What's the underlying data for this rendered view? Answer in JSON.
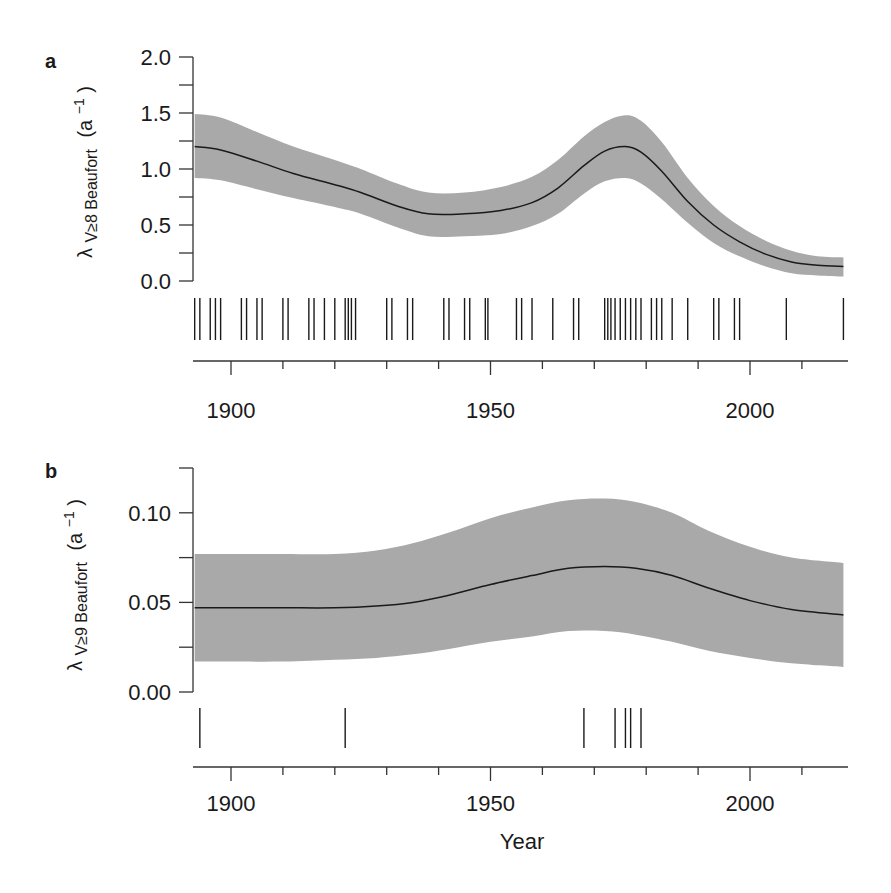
{
  "figure": {
    "colors": {
      "band": "#a9a9a9",
      "line": "#1a1a1a",
      "axis": "#333333",
      "rug": "#1a1a1a"
    }
  },
  "chart_data": [
    {
      "type": "line",
      "panel_label": "a",
      "title": "",
      "xlabel": "",
      "ylabel": "λ̂ V≥8 Beaufort (a⁻¹)",
      "ylabel_parts": {
        "hat": "λ",
        "subscript": "V≥8 Beaufort",
        "units": "(a",
        "units_exp": "−1",
        "units_close": ")"
      },
      "xlim": [
        1892.5,
        2019
      ],
      "ylim": [
        0.0,
        2.0
      ],
      "yticks": [
        0.0,
        0.5,
        1.0,
        1.5,
        2.0
      ],
      "ytick_labels": [
        "0.0",
        "0.5",
        "1.0",
        "1.5",
        "2.0"
      ],
      "yminor_step": 0.25,
      "xticks": [
        1900,
        1950,
        2000
      ],
      "xtick_labels": [
        "1900",
        "1950",
        "2000"
      ],
      "xminor_step": 10,
      "grid": false,
      "series": [
        {
          "name": "estimate",
          "x": [
            1893,
            1898,
            1905,
            1912,
            1920,
            1925,
            1932,
            1938,
            1945,
            1952,
            1958,
            1963,
            1968,
            1972,
            1976,
            1979,
            1983,
            1988,
            1993,
            1998,
            2003,
            2008,
            2013,
            2018
          ],
          "y": [
            1.2,
            1.17,
            1.07,
            0.96,
            0.86,
            0.79,
            0.67,
            0.6,
            0.6,
            0.63,
            0.7,
            0.83,
            1.03,
            1.16,
            1.2,
            1.15,
            0.98,
            0.71,
            0.5,
            0.35,
            0.24,
            0.17,
            0.14,
            0.13
          ],
          "lower": [
            0.92,
            0.9,
            0.82,
            0.74,
            0.66,
            0.6,
            0.48,
            0.4,
            0.4,
            0.42,
            0.49,
            0.6,
            0.78,
            0.89,
            0.92,
            0.87,
            0.73,
            0.52,
            0.34,
            0.22,
            0.13,
            0.07,
            0.05,
            0.04
          ],
          "upper": [
            1.49,
            1.46,
            1.33,
            1.2,
            1.08,
            1.0,
            0.87,
            0.79,
            0.79,
            0.84,
            0.93,
            1.08,
            1.29,
            1.42,
            1.48,
            1.43,
            1.24,
            0.92,
            0.67,
            0.49,
            0.36,
            0.27,
            0.22,
            0.21
          ]
        }
      ],
      "rug_events": [
        1893,
        1894,
        1896,
        1897,
        1898,
        1902,
        1903,
        1905,
        1906,
        1910,
        1911,
        1915,
        1916,
        1918,
        1920,
        1922,
        1922.6,
        1923.2,
        1924,
        1930,
        1931,
        1934,
        1935,
        1941,
        1942,
        1945,
        1946,
        1949,
        1949.5,
        1955,
        1956,
        1958,
        1962,
        1966,
        1967,
        1972,
        1972.6,
        1973.2,
        1974,
        1975,
        1976,
        1977,
        1978,
        1979,
        1981,
        1982,
        1983,
        1985,
        1988,
        1993,
        1994,
        1997,
        1998,
        2007,
        2018
      ]
    },
    {
      "type": "line",
      "panel_label": "b",
      "title": "",
      "xlabel": "Year",
      "ylabel": "λ̂ V≥9 Beaufort (a⁻¹)",
      "ylabel_parts": {
        "hat": "λ",
        "subscript": "V≥9 Beaufort",
        "units": "(a",
        "units_exp": "−1",
        "units_close": ")"
      },
      "xlim": [
        1892.5,
        2019
      ],
      "ylim": [
        0.0,
        0.125
      ],
      "yticks": [
        0.0,
        0.05,
        0.1
      ],
      "ytick_labels": [
        "0.00",
        "0.05",
        "0.10"
      ],
      "yminor_step": 0.025,
      "xticks": [
        1900,
        1950,
        2000
      ],
      "xtick_labels": [
        "1900",
        "1950",
        "2000"
      ],
      "xminor_step": 10,
      "grid": false,
      "series": [
        {
          "name": "estimate",
          "x": [
            1893,
            1900,
            1910,
            1920,
            1928,
            1935,
            1942,
            1950,
            1958,
            1965,
            1972,
            1978,
            1985,
            1992,
            2000,
            2008,
            2018
          ],
          "y": [
            0.047,
            0.047,
            0.047,
            0.047,
            0.048,
            0.05,
            0.054,
            0.06,
            0.065,
            0.069,
            0.07,
            0.069,
            0.065,
            0.058,
            0.051,
            0.046,
            0.043
          ],
          "lower": [
            0.017,
            0.017,
            0.017,
            0.018,
            0.019,
            0.021,
            0.024,
            0.028,
            0.031,
            0.034,
            0.034,
            0.032,
            0.028,
            0.023,
            0.019,
            0.016,
            0.014
          ],
          "upper": [
            0.077,
            0.077,
            0.077,
            0.077,
            0.079,
            0.083,
            0.089,
            0.097,
            0.103,
            0.107,
            0.108,
            0.106,
            0.1,
            0.09,
            0.081,
            0.075,
            0.072
          ]
        }
      ],
      "rug_events": [
        1894,
        1922,
        1968,
        1974,
        1976,
        1977,
        1979
      ]
    }
  ]
}
